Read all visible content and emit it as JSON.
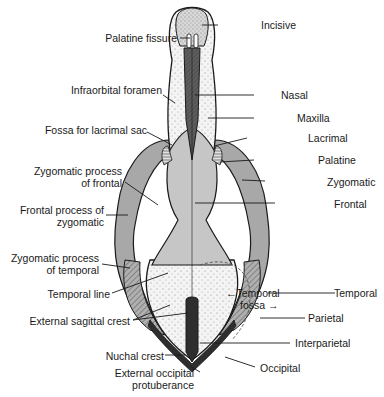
{
  "figure": {
    "colors": {
      "background": "#ffffff",
      "outline": "#1a1a1a",
      "frontal": "#c4c4c4",
      "nasal": "#5a5a5a",
      "occipital": "#2e2e2e",
      "zygomatic": "#a8a8a8",
      "stippled": "#efefef"
    },
    "labels_left": [
      {
        "id": "palatine-fissure",
        "text": "Palatine fissure"
      },
      {
        "id": "infraorbital-foramen",
        "text": "Infraorbital foramen"
      },
      {
        "id": "fossa-lacrimal-sac",
        "text": "Fossa for lacrimal sac"
      },
      {
        "id": "zygomatic-process-frontal-1",
        "text": "Zygomatic process"
      },
      {
        "id": "zygomatic-process-frontal-2",
        "text": "of frontal"
      },
      {
        "id": "frontal-process-zygomatic-1",
        "text": "Frontal process of"
      },
      {
        "id": "frontal-process-zygomatic-2",
        "text": "zygomatic"
      },
      {
        "id": "zygomatic-process-temporal-1",
        "text": "Zygomatic process"
      },
      {
        "id": "zygomatic-process-temporal-2",
        "text": "of temporal"
      },
      {
        "id": "temporal-line",
        "text": "Temporal line"
      },
      {
        "id": "external-sagittal-crest",
        "text": "External sagittal crest"
      },
      {
        "id": "nuchal-crest",
        "text": "Nuchal crest"
      },
      {
        "id": "external-occipital-1",
        "text": "External occipital"
      },
      {
        "id": "external-occipital-2",
        "text": "protuberance"
      }
    ],
    "labels_right": [
      {
        "id": "incisive",
        "text": "Incisive"
      },
      {
        "id": "nasal",
        "text": "Nasal"
      },
      {
        "id": "maxilla",
        "text": "Maxilla"
      },
      {
        "id": "lacrimal",
        "text": "Lacrimal"
      },
      {
        "id": "palatine",
        "text": "Palatine"
      },
      {
        "id": "zygomatic",
        "text": "Zygomatic"
      },
      {
        "id": "frontal",
        "text": "Frontal"
      },
      {
        "id": "temporal",
        "text": "Temporal"
      },
      {
        "id": "parietal",
        "text": "Parietal"
      },
      {
        "id": "interparietal",
        "text": "Interparietal"
      },
      {
        "id": "occipital",
        "text": "Occipital"
      }
    ],
    "labels_inner": [
      {
        "id": "temporal-fossa-1",
        "text": "←Temporal"
      },
      {
        "id": "temporal-fossa-2",
        "text": "fossa →"
      }
    ]
  }
}
